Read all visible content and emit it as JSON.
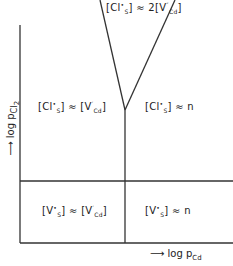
{
  "diagram": {
    "type": "defect-equilibrium-regime-map",
    "axes": {
      "x_label": {
        "arrow": "⟶",
        "text": "log p",
        "sub": "Cd"
      },
      "y_label": {
        "arrow": "⟶",
        "text": "log p",
        "sub": "Cl",
        "subsub": "2"
      }
    },
    "regions": [
      {
        "id": "top",
        "text": "[Cl•S] ≈ 2[V″Cd]",
        "parts": {
          "a": "[Cl",
          "a_sup": "•",
          "a_sub": "S",
          "b": "] ≈ 2[V",
          "b_sup": "″",
          "b_sub": "Cd",
          "c": "]"
        }
      },
      {
        "id": "upper-left",
        "text": "[Cl•S] ≈ [V′Cd]",
        "parts": {
          "a": "[Cl",
          "a_sup": "•",
          "a_sub": "S",
          "b": "] ≈ [V",
          "b_sup": "′",
          "b_sub": "Cd",
          "c": "]"
        }
      },
      {
        "id": "upper-right",
        "text": "[Cl•S] ≈ n",
        "parts": {
          "a": "[Cl",
          "a_sup": "•",
          "a_sub": "S",
          "b": "] ≈ n"
        }
      },
      {
        "id": "lower-left",
        "text": "[V•S] ≈ [V′Cd]",
        "parts": {
          "a": "[V",
          "a_sup": "•",
          "a_sub": "S",
          "b": "] ≈ [V",
          "b_sup": "′",
          "b_sub": "Cd",
          "c": "]"
        }
      },
      {
        "id": "lower-right",
        "text": "[V•S] ≈ n",
        "parts": {
          "a": "[V",
          "a_sup": "•",
          "a_sub": "S",
          "b": "] ≈ n"
        }
      }
    ],
    "line_color": "#333333"
  }
}
